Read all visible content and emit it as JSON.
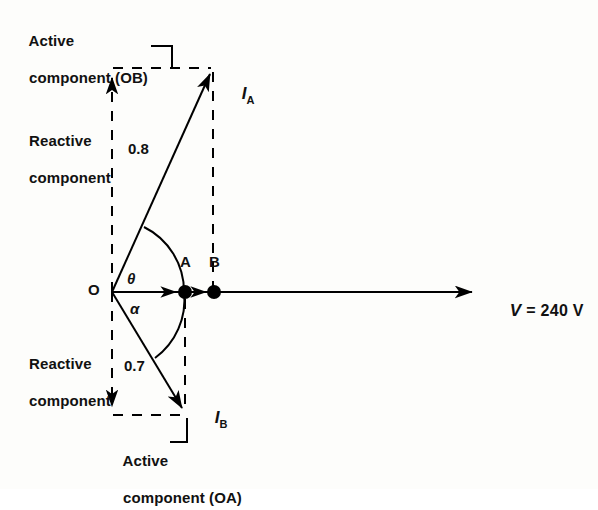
{
  "figure": {
    "type": "phasor-diagram",
    "title_text": "",
    "labels": {
      "active_component_ob_line1": "Active",
      "active_component_ob_line2": "component (OB)",
      "reactive_component_top_line1": "Reactive",
      "reactive_component_top_line2": "component",
      "reactive_component_bottom_line1": "Reactive",
      "reactive_component_bottom_line2": "component",
      "active_component_oa_line1": "Active",
      "active_component_oa_line2": "component (OA)",
      "origin": "O",
      "point_a": "A",
      "point_b": "B",
      "angle_theta": "θ",
      "angle_alpha": "α",
      "magnitude_ia": "0.8",
      "magnitude_ib": "0.7",
      "current_a_symbol": "I",
      "current_a_sub": "A",
      "current_b_symbol": "I",
      "current_b_sub": "B",
      "voltage_symbol": "V",
      "voltage_value": "= 240 V"
    },
    "colors": {
      "stroke": "#000000",
      "background": "#fdfdfb"
    },
    "geometry": {
      "origin": [
        112,
        292
      ],
      "ia_tip": [
        213,
        68
      ],
      "ib_tip": [
        185,
        415
      ],
      "point_a": [
        185,
        292
      ],
      "point_b": [
        214,
        292
      ],
      "v_tip": [
        478,
        292
      ]
    }
  }
}
